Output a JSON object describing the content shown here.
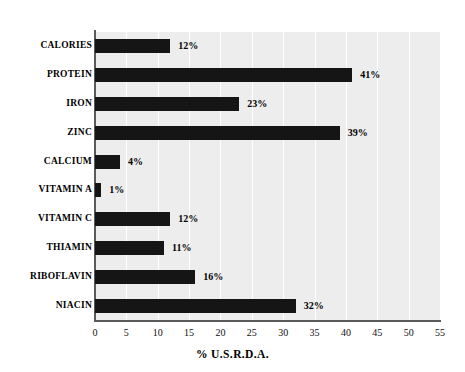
{
  "chart_data": {
    "type": "bar",
    "orientation": "horizontal",
    "title": "",
    "xlabel": "% U.S.R.D.A.",
    "ylabel": "",
    "categories": [
      "CALORIES",
      "PROTEIN",
      "IRON",
      "ZINC",
      "CALCIUM",
      "VITAMIN A",
      "VITAMIN C",
      "THIAMIN",
      "RIBOFLAVIN",
      "NIACIN"
    ],
    "values": [
      12,
      41,
      23,
      39,
      4,
      1,
      12,
      11,
      16,
      32
    ],
    "value_labels": [
      "12%",
      "41%",
      "23%",
      "39%",
      "4%",
      "1%",
      "12%",
      "11%",
      "16%",
      "32%"
    ],
    "xlim": [
      0,
      55
    ],
    "xticks": [
      0,
      5,
      10,
      15,
      20,
      25,
      30,
      35,
      40,
      45,
      50,
      55
    ],
    "xtick_labels": [
      "0",
      "5",
      "10",
      "15",
      "20",
      "25",
      "30",
      "35",
      "40",
      "45",
      "50",
      "55"
    ],
    "grid": "vertical",
    "legend": "none",
    "colors": {
      "bar": "#151515",
      "plot_background": "#ededed",
      "gridline": "#ffffff",
      "axis": "#5a5a5a",
      "text": "#000000",
      "page_background": "#ffffff"
    }
  }
}
